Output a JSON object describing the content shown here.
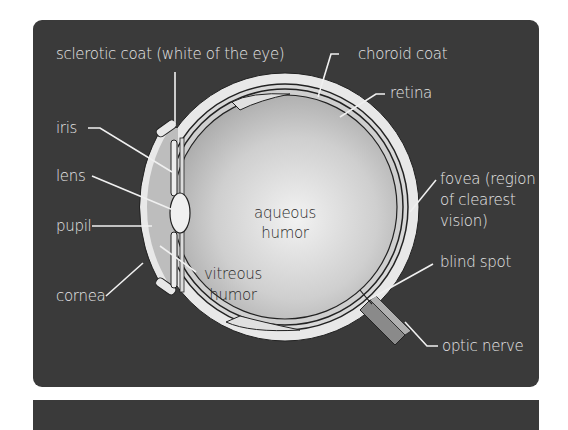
{
  "diagram": {
    "colors": {
      "panel_bg": "#3a3a3a",
      "label_text": "#e6e6e6",
      "inner_text": "#2a2a2a",
      "sclera": "#e8e8e8",
      "outline": "#222222"
    },
    "labels": {
      "sclerotic_coat": "sclerotic coat (white of the eye)",
      "choroid_coat": "choroid coat",
      "retina": "retina",
      "iris": "iris",
      "lens": "lens",
      "pupil": "pupil",
      "cornea": "cornea",
      "fovea_line1": "fovea (region",
      "fovea_line2": "of clearest",
      "fovea_line3": "vision)",
      "blind_spot": "blind spot",
      "optic_nerve": "optic nerve",
      "aqueous_line1": "aqueous",
      "aqueous_line2": "humor",
      "vitreous_line1": "vitreous",
      "vitreous_line2": "humor"
    }
  }
}
